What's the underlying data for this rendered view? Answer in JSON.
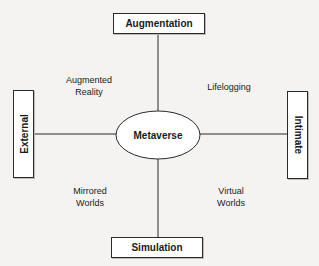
{
  "diagram": {
    "center": {
      "label": "Metaverse"
    },
    "axes": {
      "top": {
        "label": "Augmentation"
      },
      "bottom": {
        "label": "Simulation"
      },
      "left": {
        "label": "External"
      },
      "right": {
        "label": "Intimate"
      }
    },
    "quadrants": {
      "top_left": {
        "line1": "Augmented",
        "line2": "Reality"
      },
      "top_right": {
        "line1": "Lifelogging"
      },
      "bottom_left": {
        "line1": "Mirrored",
        "line2": "Worlds"
      },
      "bottom_right": {
        "line1": "Virtual",
        "line2": "Worlds"
      }
    },
    "colors": {
      "stroke": "#2a2a2a",
      "background": "#f4f3f1",
      "box_fill": "#ffffff"
    }
  }
}
